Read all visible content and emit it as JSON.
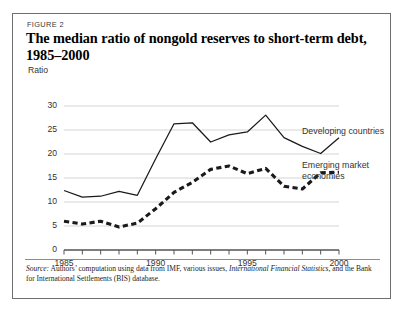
{
  "figure": {
    "label": "FIGURE 2",
    "title": "The median ratio of nongold reserves to short-term debt, 1985–2000",
    "unit_label": "Ratio"
  },
  "source": {
    "prefix": "Source:",
    "body_a": " Authors’ computation using data from IMF, various issues, ",
    "italic_a": "International Financial Statistics,",
    "body_b": " and the Bank for International Settlements (BIS) database."
  },
  "legend": {
    "developing": "Developing countries",
    "emerging_line1": "Emerging market",
    "emerging_line2": "economies"
  },
  "colors": {
    "line": "#1a1a1a",
    "grid": "#cfcfcf",
    "axis": "#555555",
    "text": "#333333",
    "border": "#6e6e6e",
    "background": "#ffffff"
  },
  "chart_data": {
    "type": "line",
    "title": "The median ratio of nongold reserves to short-term debt, 1985–2000",
    "xlabel": "",
    "ylabel": "Ratio",
    "ylim": [
      0,
      30
    ],
    "xlim": [
      1985,
      2000
    ],
    "yticks": [
      0,
      5,
      10,
      15,
      20,
      25,
      30
    ],
    "ytick_labels": [
      "0",
      "5",
      "10",
      "15",
      "20",
      "25",
      "30"
    ],
    "xticks": [
      1985,
      1986,
      1987,
      1988,
      1989,
      1990,
      1991,
      1992,
      1993,
      1994,
      1995,
      1996,
      1997,
      1998,
      1999,
      2000
    ],
    "xtick_labels_shown": [
      "1985",
      "1990",
      "1995",
      "2000"
    ],
    "xtick_labels_shown_at": [
      1985,
      1990,
      1995,
      2000
    ],
    "grid": "horizontal",
    "legend_position": "right-inline",
    "x": [
      1985,
      1986,
      1987,
      1988,
      1989,
      1990,
      1991,
      1992,
      1993,
      1994,
      1995,
      1996,
      1997,
      1998,
      1999,
      2000
    ],
    "series": [
      {
        "name": "Developing countries",
        "style": "solid",
        "values": [
          12.4,
          11.0,
          11.2,
          12.2,
          11.4,
          19.0,
          26.3,
          26.5,
          22.5,
          24.0,
          24.6,
          28.1,
          23.4,
          21.6,
          20.1,
          23.4
        ]
      },
      {
        "name": "Emerging market economies",
        "style": "dashed",
        "values": [
          6.0,
          5.4,
          6.0,
          4.8,
          5.6,
          8.6,
          12.0,
          14.1,
          16.8,
          17.5,
          15.9,
          17.0,
          13.3,
          12.7,
          16.1,
          16.2
        ]
      }
    ]
  }
}
